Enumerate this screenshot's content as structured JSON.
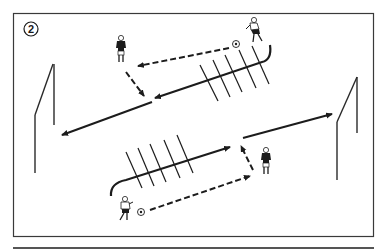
{
  "diagram": {
    "label": "2",
    "type": "soccer-drill",
    "colors": {
      "line": "#1c1c1c",
      "frame": "#3a3a3a",
      "background": "#ffffff"
    },
    "elements": {
      "goals": [
        {
          "id": "goal-left",
          "side": "left"
        },
        {
          "id": "goal-right",
          "side": "right"
        }
      ],
      "ladders": [
        {
          "id": "ladder-top",
          "rungs": 5
        },
        {
          "id": "ladder-bottom",
          "rungs": 5
        }
      ],
      "players": [
        {
          "id": "player-top-left",
          "kit": "dark"
        },
        {
          "id": "player-top-right",
          "kit": "light",
          "with_ball": true
        },
        {
          "id": "player-bottom-left",
          "kit": "light",
          "with_ball": true
        },
        {
          "id": "player-bottom-right",
          "kit": "dark"
        }
      ],
      "arrows": [
        {
          "id": "pass-top",
          "style": "dashed",
          "from": "ball-top",
          "to": "player-top-left"
        },
        {
          "id": "layoff-top",
          "style": "dashed",
          "from": "player-top-left",
          "to": "ladder-top-exit"
        },
        {
          "id": "shot-left",
          "style": "solid",
          "to": "goal-left"
        },
        {
          "id": "pass-bottom",
          "style": "dashed",
          "from": "ball-bottom",
          "to": "player-bottom-right"
        },
        {
          "id": "layoff-bottom",
          "style": "dashed",
          "from": "player-bottom-right",
          "to": "ladder-bottom-exit"
        },
        {
          "id": "shot-right",
          "style": "solid",
          "to": "goal-right"
        }
      ]
    }
  }
}
